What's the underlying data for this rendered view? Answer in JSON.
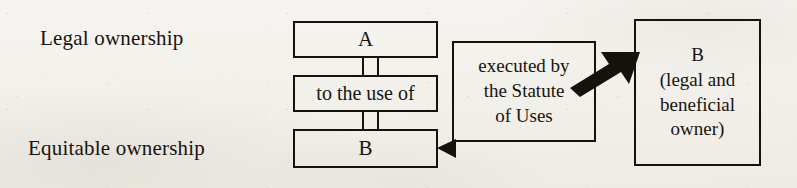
{
  "figure": {
    "kind": "flow-diagram",
    "ink_color": "#15120e",
    "paper_color": "#f3f1ec"
  },
  "labels": {
    "legal": "Legal ownership",
    "equitable": "Equitable ownership"
  },
  "nodes": {
    "grantee_a": "A",
    "use_clause": "to the use of",
    "beneficiary_b": "B",
    "statute": "executed by\nthe Statute\nof Uses",
    "final_owner": "B\n(legal and\nbeneficial\nowner)"
  },
  "connectors": {
    "a_to_use": "double-rail-link",
    "use_to_b": "double-rail-link",
    "statute_to_b_equity": "left-arrowhead",
    "statute_to_final_owner": "thick-up-right-arrow"
  }
}
